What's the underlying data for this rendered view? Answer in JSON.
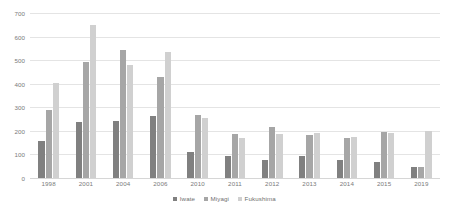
{
  "chart_data": {
    "type": "bar",
    "title": "",
    "xlabel": "",
    "ylabel": "",
    "ylim": [
      0,
      700
    ],
    "yticks": [
      0,
      100,
      200,
      300,
      400,
      500,
      600,
      700
    ],
    "grid": true,
    "legend_position": "bottom",
    "categories": [
      "1998",
      "2001",
      "2004",
      "2006",
      "2010",
      "2011",
      "2012",
      "2013",
      "2014",
      "2015",
      "2019"
    ],
    "series": [
      {
        "name": "Iwate",
        "color": "#808080",
        "values": [
          158,
          238,
          242,
          262,
          110,
          92,
          78,
          92,
          75,
          66,
          48
        ]
      },
      {
        "name": "Miyagi",
        "color": "#a6a6a6",
        "values": [
          290,
          493,
          541,
          430,
          267,
          186,
          218,
          184,
          168,
          194,
          45
        ]
      },
      {
        "name": "Fukushima",
        "color": "#d0d0d0",
        "values": [
          405,
          648,
          480,
          533,
          255,
          170,
          187,
          192,
          173,
          193,
          198
        ]
      }
    ]
  },
  "axes": {
    "y_tick_labels": [
      "700",
      "600",
      "500",
      "400",
      "300",
      "200",
      "100",
      "0"
    ],
    "x_tick_labels": [
      "1998",
      "2001",
      "2004",
      "2006",
      "2010",
      "2011",
      "2012",
      "2013",
      "2014",
      "2015",
      "2019"
    ]
  },
  "legend": {
    "items": [
      {
        "label": "Iwate",
        "swatch": "s0"
      },
      {
        "label": "Miyagi",
        "swatch": "s1"
      },
      {
        "label": "Fukushima",
        "swatch": "s2"
      }
    ]
  }
}
